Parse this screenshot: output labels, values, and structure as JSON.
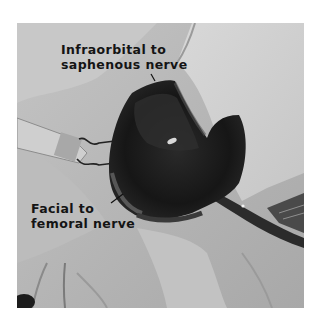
{
  "figure": {
    "type": "grayscale surgical photograph",
    "annotations": [
      {
        "id": "infraorbital",
        "lines": [
          "Infraorbital to",
          "saphenous nerve"
        ]
      },
      {
        "id": "facial",
        "lines": [
          "Facial to",
          "femoral nerve"
        ]
      }
    ],
    "colors": {
      "background": "#ffffff",
      "label_text": "#141414",
      "tissue_dark": "#1a1a1a",
      "gauze": "#d2d2d2",
      "fur": "#bdbdbd"
    }
  }
}
